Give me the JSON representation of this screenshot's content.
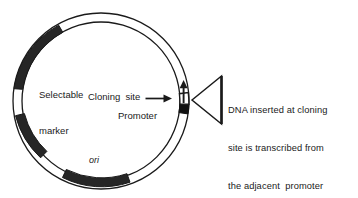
{
  "figure": {
    "type": "plasmid-vector-diagram",
    "background_color": "#ffffff",
    "stroke_color": "#1a1a1a",
    "fill_color": "#262626"
  },
  "plasmid": {
    "center_x": 101,
    "center_y": 101,
    "outer_radius": 88,
    "inner_radius": 79,
    "segments": [
      {
        "name": "selectable-marker-segment",
        "start_deg": 188,
        "end_deg": 258,
        "fill": "#262626"
      },
      {
        "name": "lower-left-segment",
        "start_deg": 112,
        "end_deg": 150,
        "fill": "#262626"
      },
      {
        "name": "ori-segment",
        "start_deg": 75,
        "end_deg": 108,
        "fill": "#262626"
      },
      {
        "name": "promoter-segment",
        "start_deg": 347,
        "end_deg": 5,
        "fill": "#1a1a1a"
      }
    ]
  },
  "labels": {
    "selectable_marker_line1": "Selectable",
    "selectable_marker_line2": "marker",
    "cloning_site": "Cloning  site",
    "promoter": "Promoter",
    "ori": "ori"
  },
  "callout": {
    "line1": "DNA inserted at cloning",
    "line2": "site is transcribed from",
    "line3": "the adjacent  promoter"
  },
  "icons": {
    "transcription_arrow": "up-arrow-icon",
    "cloning_site_pointer": "right-arrow-icon",
    "callout_wedge": "left-pointing-triangle-icon"
  }
}
